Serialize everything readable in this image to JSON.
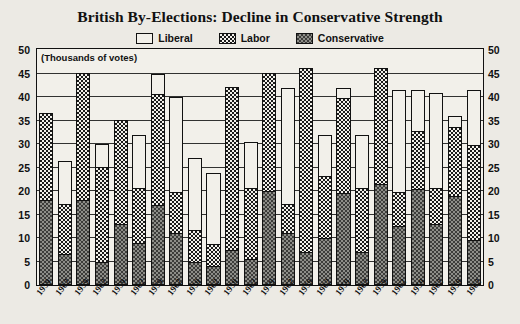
{
  "title": "British By-Elections: Decline in Conservative Strength",
  "legend": [
    {
      "label": "Liberal",
      "key": "liberal",
      "color": "#f2f0ea"
    },
    {
      "label": "Labor",
      "key": "labor",
      "color": "#1a1a1a"
    },
    {
      "label": "Conservative",
      "key": "conservative",
      "color": "#8d8d88"
    }
  ],
  "axis": {
    "units_note": "(Thousands of votes)",
    "ticks": [
      "50",
      "45",
      "40",
      "35",
      "30",
      "25",
      "20",
      "15",
      "10",
      "5",
      "0"
    ],
    "left_axis_title": "",
    "right_axis_title": ""
  },
  "chart_data": {
    "type": "bar",
    "title": "British By-Elections: Decline in Conservative Strength",
    "subtype": "stacked-vertical",
    "xlabel": "",
    "ylabel": "(Thousands of votes)",
    "ylim": [
      0,
      50
    ],
    "ytick_values": [
      0,
      5,
      10,
      15,
      20,
      25,
      30,
      35,
      40,
      45,
      50
    ],
    "grid": true,
    "legend_position": "top-center",
    "categories": [
      "1959",
      "1962",
      "1959",
      "1962",
      "1959",
      "1962",
      "1959",
      "1962",
      "1959",
      "1962",
      "1959",
      "1962",
      "1959",
      "1962",
      "1959",
      "1962",
      "1959",
      "1962",
      "1959",
      "1962",
      "1959",
      "1962",
      "1959",
      "1962"
    ],
    "series": [
      {
        "name": "Conservative",
        "values": [
          18,
          6.5,
          18,
          5,
          13,
          9,
          17,
          11,
          5,
          4,
          7.5,
          5.5,
          20,
          11,
          7,
          10,
          19.5,
          7,
          21.5,
          12.5,
          20.5,
          13,
          19,
          9.5
        ]
      },
      {
        "name": "Labor",
        "values": [
          19,
          11,
          27.5,
          20.5,
          22.5,
          12,
          24,
          9,
          7,
          5,
          35,
          15.5,
          25.5,
          6.5,
          39.5,
          13.5,
          20.5,
          14,
          25,
          7.5,
          12.5,
          8,
          15,
          20.5
        ]
      },
      {
        "name": "Liberal",
        "values": [
          0,
          9.5,
          0,
          5,
          0,
          11.5,
          4.5,
          20.5,
          15.5,
          15.5,
          0,
          10,
          0,
          25,
          0,
          9,
          2.5,
          11.5,
          0,
          22,
          9,
          20.5,
          2.5,
          12
        ]
      }
    ],
    "totals": [
      37,
      27,
      45.5,
      30.5,
      35.5,
      32.5,
      45.5,
      40.5,
      27.5,
      24.5,
      42.5,
      31,
      45.5,
      42.5,
      46.5,
      32.5,
      42.5,
      32.5,
      46.5,
      42,
      42,
      41.5,
      36.5,
      42
    ]
  }
}
